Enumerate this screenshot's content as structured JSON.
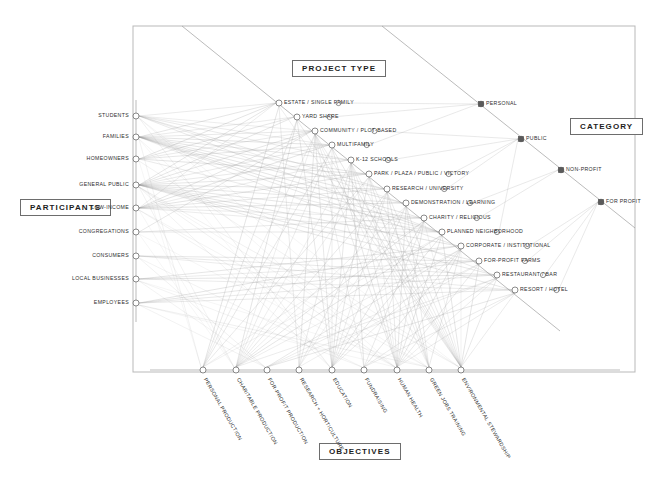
{
  "axes": {
    "participants": {
      "title": "PARTICIPANTS",
      "orientation": "vertical-left",
      "items": [
        {
          "label": "STUDENTS",
          "x": 136,
          "y": 116
        },
        {
          "label": "FAMILIES",
          "x": 136,
          "y": 137
        },
        {
          "label": "HOMEOWNERS",
          "x": 136,
          "y": 159
        },
        {
          "label": "GENERAL PUBLIC",
          "x": 136,
          "y": 185
        },
        {
          "label": "LOW-INCOME",
          "x": 136,
          "y": 208
        },
        {
          "label": "CONGREGATIONS",
          "x": 136,
          "y": 232
        },
        {
          "label": "CONSUMERS",
          "x": 136,
          "y": 256
        },
        {
          "label": "LOCAL BUSINESSES",
          "x": 136,
          "y": 279
        },
        {
          "label": "EMPLOYEES",
          "x": 136,
          "y": 303
        }
      ]
    },
    "project_type": {
      "title": "PROJECT TYPE",
      "orientation": "diagonal-down-right",
      "items": [
        {
          "label": "ESTATE / SINGLE FAMILY",
          "x": 279,
          "y": 103
        },
        {
          "label": "YARD SHARE",
          "x": 297,
          "y": 117
        },
        {
          "label": "COMMUNITY / PLOT-BASED",
          "x": 315,
          "y": 131
        },
        {
          "label": "MULTIFAMILY",
          "x": 332,
          "y": 145
        },
        {
          "label": "K-12 SCHOOLS",
          "x": 351,
          "y": 160
        },
        {
          "label": "PARK / PLAZA / PUBLIC / VICTORY",
          "x": 369,
          "y": 174
        },
        {
          "label": "RESEARCH / UNIVERSITY",
          "x": 387,
          "y": 189
        },
        {
          "label": "DEMONSTRATION / LEARNING",
          "x": 406,
          "y": 203
        },
        {
          "label": "CHARITY / RELIGIOUS",
          "x": 424,
          "y": 218
        },
        {
          "label": "PLANNED NEIGHBORHOOD",
          "x": 442,
          "y": 232
        },
        {
          "label": "CORPORATE / INSTITUTIONAL",
          "x": 461,
          "y": 246
        },
        {
          "label": "FOR-PROFIT FARMS",
          "x": 479,
          "y": 261
        },
        {
          "label": "RESTAURANT / BAR",
          "x": 497,
          "y": 275
        },
        {
          "label": "RESORT / HOTEL",
          "x": 515,
          "y": 290
        }
      ]
    },
    "category": {
      "title": "CATEGORY",
      "orientation": "diagonal-down-right",
      "items": [
        {
          "label": "PERSONAL",
          "x": 481,
          "y": 104
        },
        {
          "label": "PUBLIC",
          "x": 521,
          "y": 139
        },
        {
          "label": "NON-PROFIT",
          "x": 561,
          "y": 170
        },
        {
          "label": "FOR PROFIT",
          "x": 601,
          "y": 202
        }
      ]
    },
    "objectives": {
      "title": "OBJECTIVES",
      "orientation": "horizontal-bottom",
      "items": [
        {
          "label": "PERSONAL PRODUCTION",
          "x": 203,
          "y": 370
        },
        {
          "label": "CHARITABLE PRODUCTION",
          "x": 236,
          "y": 370
        },
        {
          "label": "FOR-PROFIT PRODUCTION",
          "x": 267,
          "y": 370
        },
        {
          "label": "RESEARCH + HORTICULTURE",
          "x": 299,
          "y": 370
        },
        {
          "label": "EDUCATION",
          "x": 332,
          "y": 370
        },
        {
          "label": "FUNDRAISING",
          "x": 364,
          "y": 370
        },
        {
          "label": "HUMAN HEALTH",
          "x": 397,
          "y": 370
        },
        {
          "label": "GREEN JOBS TRAINING",
          "x": 429,
          "y": 370
        },
        {
          "label": "ENVIRONMENTAL STEWARDSHIP",
          "x": 461,
          "y": 370
        }
      ]
    }
  },
  "frame": {
    "x": 133,
    "y": 26,
    "width": 502,
    "height": 346
  },
  "colors": {
    "frame": "#b9b9b9",
    "axis": "#9a9a9a",
    "node_stroke": "#5a5a5a",
    "link": "#9d9d9d",
    "link_strong": "#5d5d5d",
    "text": "#2d2d2d",
    "background": "#ffffff"
  },
  "chart_data": {
    "type": "diagram",
    "links_summary": {
      "participants_to_project_type": 61,
      "project_type_to_category": 14,
      "project_type_to_objectives": 77,
      "participants_to_objectives": 24
    }
  }
}
